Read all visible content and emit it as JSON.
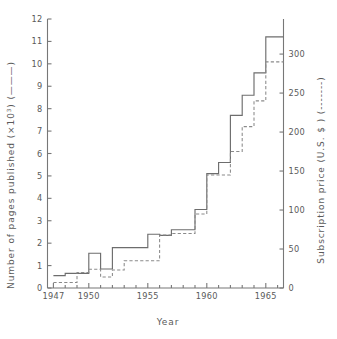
{
  "chart_data": {
    "type": "line",
    "subtype": "step",
    "title": "",
    "xlabel": "Year",
    "ylabel": "Number of pages published (×10³) (———)",
    "y2label": "Subscription price (U.S. $ ) (-------)",
    "xlim": [
      1946.5,
      1966.5
    ],
    "ylim": [
      0,
      12
    ],
    "y2lim": [
      0,
      345
    ],
    "grid": false,
    "legend_position": "in-axis-titles",
    "x_ticks": [
      1947,
      1950,
      1955,
      1960,
      1965
    ],
    "x_tick_labels": [
      "1947",
      "1950",
      "1955",
      "1960",
      "1965"
    ],
    "x_minor_ticks": [
      1948,
      1949,
      1951,
      1952,
      1953,
      1954,
      1956,
      1957,
      1958,
      1959,
      1961,
      1962,
      1963,
      1964,
      1966
    ],
    "y_ticks": [
      0,
      1,
      2,
      3,
      4,
      5,
      6,
      7,
      8,
      9,
      10,
      11,
      12
    ],
    "y_tick_labels": [
      "0",
      "1",
      "2",
      "3",
      "4",
      "5",
      "6",
      "7",
      "8",
      "9",
      "10",
      "11",
      "12"
    ],
    "y2_ticks": [
      0,
      50,
      100,
      150,
      200,
      250,
      300
    ],
    "y2_tick_labels": [
      "0",
      "50",
      "100",
      "150",
      "200",
      "250",
      "300"
    ],
    "x": [
      1947,
      1948,
      1949,
      1950,
      1951,
      1952,
      1953,
      1954,
      1955,
      1956,
      1957,
      1958,
      1959,
      1960,
      1961,
      1962,
      1963,
      1964,
      1965,
      1966
    ],
    "series": [
      {
        "name": "Number of pages published (×10³)",
        "style": "solid",
        "axis": "left",
        "values": [
          0.55,
          0.65,
          0.65,
          1.55,
          0.85,
          1.8,
          1.8,
          1.8,
          2.4,
          2.35,
          2.6,
          2.6,
          3.5,
          5.1,
          5.6,
          7.7,
          8.6,
          9.6,
          11.2,
          11.2
        ]
      },
      {
        "name": "Subscription price (U.S. $)",
        "style": "dashed",
        "axis": "right",
        "values": [
          7,
          7,
          20,
          24,
          14,
          23,
          35,
          35,
          35,
          68,
          70,
          70,
          95,
          145,
          145,
          175,
          207,
          240,
          290,
          290
        ]
      }
    ],
    "series_left_note": "solid step curve, left axis, thousands of pages",
    "series_right_note": "dashed step curve, right axis, U.S. dollars"
  },
  "figure": {
    "x_axis_title": "Year",
    "left_axis_title_main": "Number of pages published (×10",
    "left_axis_title_sup": "3",
    "left_axis_title_tail": ") (———)",
    "right_axis_title_main": "Subscription price (U.S. $ ) (",
    "right_axis_title_tail": ")",
    "right_axis_dash_marker": "-------",
    "colors": {
      "background": "#ffffff",
      "axis": "#777777",
      "solid_series": "#6d6d6d",
      "dashed_series": "#8a8a8a",
      "text": "#5a5a5a"
    }
  }
}
